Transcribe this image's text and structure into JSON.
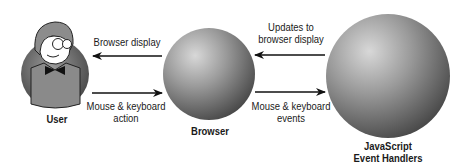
{
  "diagram": {
    "nodes": [
      {
        "id": "user",
        "label": "User",
        "icon": "user-avatar-icon"
      },
      {
        "id": "browser",
        "label": "Browser",
        "icon": "sphere-icon"
      },
      {
        "id": "js",
        "label_line1": "JavaScript",
        "label_line2": "Event Handlers",
        "icon": "sphere-icon"
      }
    ],
    "edges": [
      {
        "from": "browser",
        "to": "user",
        "label": "Browser display"
      },
      {
        "from": "user",
        "to": "browser",
        "label_line1": "Mouse & keyboard",
        "label_line2": "action"
      },
      {
        "from": "js",
        "to": "browser",
        "label_line1": "Updates to",
        "label_line2": "browser display"
      },
      {
        "from": "browser",
        "to": "js",
        "label_line1": "Mouse & keyboard",
        "label_line2": "events"
      }
    ]
  },
  "colors": {
    "text": "#1a1a1a",
    "arrow": "#111111",
    "sphere_light": "#d6d6d6",
    "sphere_dark": "#4a4a4a",
    "background": "#ffffff"
  }
}
